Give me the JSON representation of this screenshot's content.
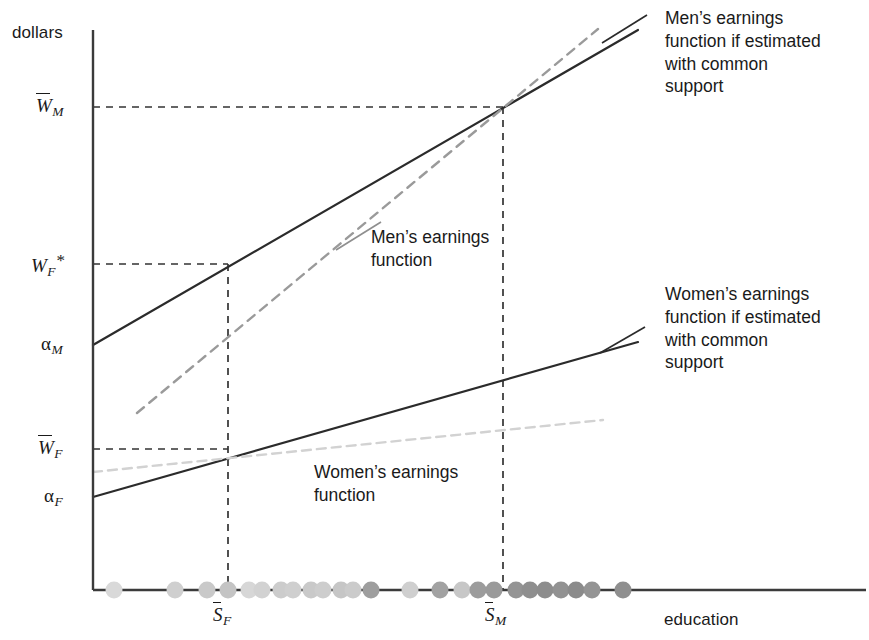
{
  "figure": {
    "type": "economics-diagram",
    "y_axis_label": "dollars",
    "x_axis_label": "education"
  },
  "y_ticks": [
    {
      "id": "w_bar_m",
      "base": "W",
      "sub": "M",
      "overbar": true,
      "star": false,
      "y": 107
    },
    {
      "id": "w_f_star",
      "base": "W",
      "sub": "F",
      "overbar": false,
      "star": true,
      "y": 264
    },
    {
      "id": "alpha_m",
      "base": "α",
      "sub": "M",
      "overbar": false,
      "star": false,
      "y": 345
    },
    {
      "id": "w_bar_f",
      "base": "W",
      "sub": "F",
      "overbar": true,
      "star": false,
      "y": 449
    },
    {
      "id": "alpha_f",
      "base": "α",
      "sub": "F",
      "overbar": false,
      "star": false,
      "y": 497
    }
  ],
  "x_ticks": [
    {
      "id": "s_bar_f",
      "base": "S",
      "sub": "F",
      "overbar": true,
      "x": 228
    },
    {
      "id": "s_bar_m",
      "base": "S",
      "sub": "M",
      "overbar": true,
      "x": 503
    }
  ],
  "annotations": {
    "men_common_support": "Men’s earnings\nfunction if estimated\nwith common\nsupport",
    "women_common_support": "Women’s earnings\nfunction if estimated\nwith common\nsupport",
    "men_function": "Men’s earnings\nfunction",
    "women_function": "Women’s earnings\nfunction"
  },
  "colors": {
    "axis": "#3b3b3b",
    "solid_line": "#2b2b2b",
    "men_dashed": "#9a9a9a",
    "women_dashed": "#d2d2d2",
    "guide_dashed": "#333333",
    "text": "#1a1a1a"
  },
  "chart_data": {
    "type": "line",
    "title": "",
    "xlabel": "education",
    "ylabel": "dollars",
    "grid": false,
    "legend": "annotations",
    "series": [
      {
        "name": "Men's earnings function if estimated with common support",
        "style": "solid-black",
        "points": [
          [
            93,
            345
          ],
          [
            638,
            30
          ]
        ]
      },
      {
        "name": "Men's earnings function",
        "style": "dashed-gray",
        "points": [
          [
            137,
            413
          ],
          [
            598,
            29
          ]
        ]
      },
      {
        "name": "Women's earnings function if estimated with common support",
        "style": "solid-black",
        "points": [
          [
            93,
            497
          ],
          [
            638,
            342
          ]
        ]
      },
      {
        "name": "Women's earnings function",
        "style": "dashed-lightgray",
        "points": [
          [
            93,
            472
          ],
          [
            603,
            420
          ]
        ]
      }
    ],
    "guides": [
      {
        "name": "w_bar_m-horizontal",
        "from": [
          93,
          107
        ],
        "to": [
          503,
          107
        ]
      },
      {
        "name": "s_bar_m-vertical",
        "from": [
          503,
          107
        ],
        "to": [
          503,
          590
        ]
      },
      {
        "name": "w_f_star-horizontal",
        "from": [
          93,
          264
        ],
        "to": [
          228,
          264
        ]
      },
      {
        "name": "s_bar_f-vertical",
        "from": [
          228,
          264
        ],
        "to": [
          228,
          590
        ]
      },
      {
        "name": "w_bar_f-horizontal",
        "from": [
          93,
          449
        ],
        "to": [
          228,
          449
        ]
      }
    ],
    "scatter": {
      "name": "education support (observations)",
      "y": 590,
      "points": [
        {
          "x": 114,
          "shade": "#d9d9d9"
        },
        {
          "x": 175,
          "shade": "#cfcfcf"
        },
        {
          "x": 207,
          "shade": "#c9c9c9"
        },
        {
          "x": 228,
          "shade": "#c4c4c4"
        },
        {
          "x": 249,
          "shade": "#d7d7d7"
        },
        {
          "x": 262,
          "shade": "#d2d2d2"
        },
        {
          "x": 281,
          "shade": "#cccccc"
        },
        {
          "x": 293,
          "shade": "#cfcfcf"
        },
        {
          "x": 311,
          "shade": "#c9c9c9"
        },
        {
          "x": 323,
          "shade": "#cdcdcd"
        },
        {
          "x": 341,
          "shade": "#c6c6c6"
        },
        {
          "x": 353,
          "shade": "#cbcbcb"
        },
        {
          "x": 371,
          "shade": "#9e9e9e"
        },
        {
          "x": 410,
          "shade": "#cfcfcf"
        },
        {
          "x": 440,
          "shade": "#a2a2a2"
        },
        {
          "x": 462,
          "shade": "#c7c7c7"
        },
        {
          "x": 478,
          "shade": "#9c9c9c"
        },
        {
          "x": 494,
          "shade": "#9a9a9a"
        },
        {
          "x": 516,
          "shade": "#949494"
        },
        {
          "x": 530,
          "shade": "#8f8f8f"
        },
        {
          "x": 545,
          "shade": "#8d8d8d"
        },
        {
          "x": 561,
          "shade": "#929292"
        },
        {
          "x": 576,
          "shade": "#8b8b8b"
        },
        {
          "x": 592,
          "shade": "#949494"
        },
        {
          "x": 623,
          "shade": "#8f8f8f"
        }
      ]
    },
    "xlim": [
      93,
      869
    ],
    "ylim": [
      590,
      20
    ]
  }
}
